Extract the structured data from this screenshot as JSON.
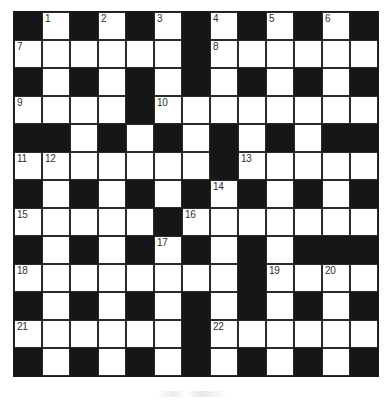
{
  "puzzle": {
    "title": "Crossword Grid",
    "rows": 13,
    "columns": 13,
    "cell_size_px": 28,
    "block_color": "#161616",
    "open_color": "#ffffff",
    "border_color": "#2b2b2b",
    "number_color": "#2f2f2f",
    "clue_number_count": 22,
    "grid": [
      [
        "block",
        "open",
        "block",
        "open",
        "block",
        "open",
        "block",
        "open",
        "block",
        "open",
        "block",
        "open",
        "block"
      ],
      [
        "open",
        "open",
        "open",
        "open",
        "open",
        "open",
        "block",
        "open",
        "open",
        "open",
        "open",
        "open",
        "open"
      ],
      [
        "block",
        "open",
        "block",
        "open",
        "block",
        "open",
        "block",
        "open",
        "block",
        "open",
        "block",
        "open",
        "block"
      ],
      [
        "open",
        "open",
        "open",
        "open",
        "block",
        "open",
        "open",
        "open",
        "open",
        "open",
        "open",
        "open",
        "open"
      ],
      [
        "block",
        "block",
        "open",
        "block",
        "open",
        "block",
        "open",
        "block",
        "open",
        "block",
        "open",
        "block",
        "block"
      ],
      [
        "open",
        "open",
        "open",
        "open",
        "open",
        "open",
        "open",
        "block",
        "open",
        "open",
        "open",
        "open",
        "open"
      ],
      [
        "block",
        "open",
        "block",
        "open",
        "block",
        "open",
        "block",
        "open",
        "block",
        "open",
        "block",
        "open",
        "block"
      ],
      [
        "open",
        "open",
        "open",
        "open",
        "open",
        "block",
        "open",
        "open",
        "open",
        "open",
        "open",
        "open",
        "open"
      ],
      [
        "block",
        "open",
        "block",
        "open",
        "block",
        "open",
        "block",
        "open",
        "block",
        "open",
        "block",
        "block",
        "block"
      ],
      [
        "open",
        "open",
        "open",
        "open",
        "open",
        "open",
        "open",
        "open",
        "block",
        "open",
        "open",
        "open",
        "open"
      ],
      [
        "block",
        "open",
        "block",
        "open",
        "block",
        "open",
        "block",
        "open",
        "block",
        "open",
        "block",
        "open",
        "block"
      ],
      [
        "open",
        "open",
        "open",
        "open",
        "open",
        "open",
        "block",
        "open",
        "open",
        "open",
        "open",
        "open",
        "open"
      ],
      [
        "block",
        "open",
        "block",
        "open",
        "block",
        "open",
        "block",
        "open",
        "block",
        "open",
        "block",
        "open",
        "block"
      ]
    ],
    "numbers": [
      {
        "row": 0,
        "col": 1,
        "label": "1"
      },
      {
        "row": 0,
        "col": 3,
        "label": "2"
      },
      {
        "row": 0,
        "col": 5,
        "label": "3"
      },
      {
        "row": 0,
        "col": 7,
        "label": "4"
      },
      {
        "row": 0,
        "col": 9,
        "label": "5"
      },
      {
        "row": 0,
        "col": 11,
        "label": "6"
      },
      {
        "row": 1,
        "col": 0,
        "label": "7"
      },
      {
        "row": 1,
        "col": 7,
        "label": "8"
      },
      {
        "row": 3,
        "col": 0,
        "label": "9"
      },
      {
        "row": 3,
        "col": 5,
        "label": "10"
      },
      {
        "row": 5,
        "col": 0,
        "label": "11"
      },
      {
        "row": 5,
        "col": 1,
        "label": "12"
      },
      {
        "row": 5,
        "col": 8,
        "label": "13"
      },
      {
        "row": 6,
        "col": 7,
        "label": "14"
      },
      {
        "row": 7,
        "col": 0,
        "label": "15"
      },
      {
        "row": 7,
        "col": 6,
        "label": "16"
      },
      {
        "row": 8,
        "col": 5,
        "label": "17"
      },
      {
        "row": 9,
        "col": 0,
        "label": "18"
      },
      {
        "row": 9,
        "col": 9,
        "label": "19"
      },
      {
        "row": 9,
        "col": 11,
        "label": "20"
      },
      {
        "row": 11,
        "col": 0,
        "label": "21"
      },
      {
        "row": 11,
        "col": 7,
        "label": "22"
      }
    ]
  }
}
